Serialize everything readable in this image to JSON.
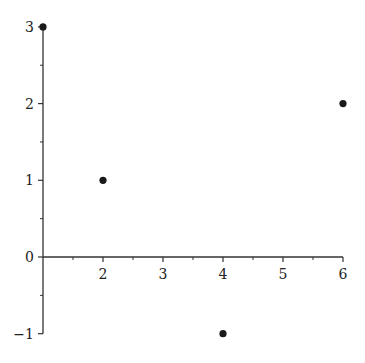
{
  "chart_data": {
    "type": "scatter",
    "title": "",
    "xlabel": "",
    "ylabel": "",
    "x": [
      1,
      2,
      4,
      6
    ],
    "y": [
      3,
      1,
      -1,
      2
    ],
    "xlim": [
      1,
      6
    ],
    "ylim": [
      -1,
      3
    ],
    "x_ticks": [
      2,
      3,
      4,
      5,
      6
    ],
    "y_ticks": [
      -1,
      0,
      1,
      2,
      3
    ],
    "x_minor_ticks": [
      1.5,
      2.5,
      3.5,
      4.5,
      5.5
    ],
    "y_minor_ticks": [
      -0.5,
      0.5,
      1.5,
      2.5
    ],
    "x_axis_crosses_y_at": 0,
    "y_axis_crosses_x_at": 1,
    "grid": false,
    "legend": null,
    "marker_color": "#1a1a1a",
    "axis_color": "#333333"
  }
}
